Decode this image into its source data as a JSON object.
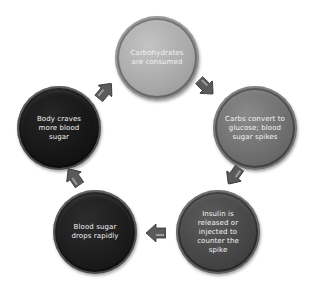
{
  "diagram": {
    "type": "cycle",
    "nodes": [
      {
        "id": "carbs-consumed",
        "label": "Carbohydrates are consumed",
        "color": "#a9a9a9",
        "x": 115,
        "y": 16
      },
      {
        "id": "glucose-spike",
        "label": "Carbs convert to glucose; blood sugar spikes",
        "color": "#6e6e6e",
        "x": 213,
        "y": 86
      },
      {
        "id": "insulin-released",
        "label": "Insulin is released or injected to counter the spike",
        "color": "#464646",
        "x": 176,
        "y": 190
      },
      {
        "id": "sugar-drops",
        "label": "Blood sugar drops rapidly",
        "color": "#1c1c1c",
        "x": 53,
        "y": 190
      },
      {
        "id": "body-craves",
        "label": "Body craves more blood sugar",
        "color": "#161616",
        "x": 17,
        "y": 86
      }
    ],
    "arrows": [
      {
        "from": "carbs-consumed",
        "to": "glucose-spike",
        "direction": "down-right"
      },
      {
        "from": "glucose-spike",
        "to": "insulin-released",
        "direction": "down-left"
      },
      {
        "from": "insulin-released",
        "to": "sugar-drops",
        "direction": "left"
      },
      {
        "from": "sugar-drops",
        "to": "body-craves",
        "direction": "up-left"
      },
      {
        "from": "body-craves",
        "to": "carbs-consumed",
        "direction": "up-right"
      }
    ],
    "arrow_color": "#5a5a5a"
  }
}
